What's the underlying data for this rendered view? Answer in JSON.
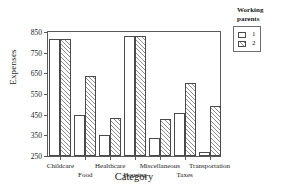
{
  "chart_data": {
    "type": "bar",
    "title": "",
    "xlabel": "Category",
    "ylabel": "Expenses",
    "ylim": [
      250,
      850
    ],
    "yticks": [
      250,
      350,
      450,
      550,
      650,
      750,
      850
    ],
    "grid": false,
    "legend_position": "right-top",
    "legend_title_line1": "Working",
    "legend_title_line2": "parents",
    "categories": [
      "Childcare",
      "Food",
      "Healthcare",
      "Housing",
      "Miscellaneous",
      "Taxes",
      "Transportation"
    ],
    "series": [
      {
        "name": "1",
        "values": [
          815,
          448,
          353,
          833,
          338,
          458,
          268
        ]
      },
      {
        "name": "2",
        "values": [
          815,
          638,
          432,
          833,
          428,
          605,
          490
        ]
      }
    ]
  }
}
